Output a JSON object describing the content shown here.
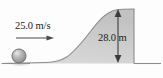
{
  "figure": {
    "name": "projectile-over-hill-diagram",
    "type": "physics-free-body-diagram",
    "background_color": "#fdfdfd"
  },
  "annotations": {
    "velocity": {
      "text": "25.0 m/s",
      "value": 25.0,
      "unit": "m/s",
      "direction": "horizontal-right"
    },
    "height": {
      "text": "28.0 m",
      "value": 28.0,
      "unit": "m",
      "direction": "vertical-double-headed"
    }
  },
  "objects": {
    "ball": {
      "name": "ball",
      "fill_color": "#a9a9a9",
      "highlight_color": "#e2e2e2",
      "stroke_color": "#6f6f6f",
      "center_x": 19,
      "center_y": 56,
      "radius": 7
    },
    "hill": {
      "name": "hill-slope",
      "fill_color": "#cfcfcf",
      "stroke_color": "#8c8c8c",
      "shape": "sigmoid-rise-to-cliff",
      "peak_x": 128,
      "peak_y": 9
    },
    "ground": {
      "name": "ground-line",
      "stroke_color": "#8c8c8c",
      "baseline_y": 64
    },
    "cliff": {
      "name": "cliff-face",
      "stroke_color": "#8c8c8c",
      "x": 134,
      "top_y": 9,
      "bottom_y": 64
    }
  },
  "colors": {
    "line": "#7d7d7d",
    "arrow": "#4a4a4a",
    "text": "#1b1b1b",
    "fill": "#cfcfcf"
  }
}
